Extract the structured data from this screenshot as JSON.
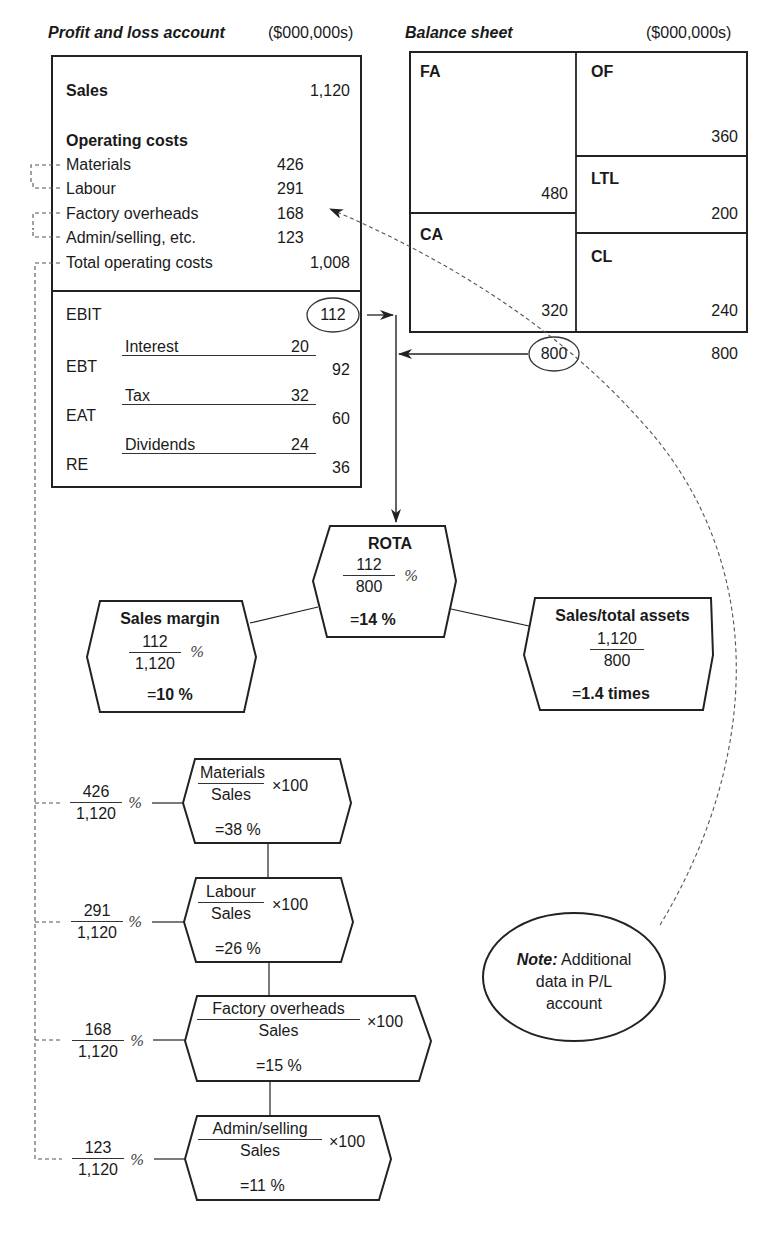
{
  "pl": {
    "title": "Profit and loss account",
    "units": "($000,000s)",
    "sales_label": "Sales",
    "sales_value": "1,120",
    "opcosts_heading": "Operating costs",
    "opcosts": [
      {
        "label": "Materials",
        "value": "426"
      },
      {
        "label": "Labour",
        "value": "291"
      },
      {
        "label": "Factory overheads",
        "value": "168"
      },
      {
        "label": "Admin/selling, etc.",
        "value": "123"
      }
    ],
    "total_label": "Total operating costs",
    "total_value": "1,008",
    "ebit_label": "EBIT",
    "ebit_value": "112",
    "interest_label": "Interest",
    "interest_value": "20",
    "ebt_label": "EBT",
    "ebt_value": "92",
    "tax_label": "Tax",
    "tax_value": "32",
    "eat_label": "EAT",
    "eat_value": "60",
    "dividends_label": "Dividends",
    "dividends_value": "24",
    "re_label": "RE",
    "re_value": "36"
  },
  "bs": {
    "title": "Balance sheet",
    "units": "($000,000s)",
    "fa_label": "FA",
    "fa_value": "480",
    "ca_label": "CA",
    "ca_value": "320",
    "of_label": "OF",
    "of_value": "360",
    "ltl_label": "LTL",
    "ltl_value": "200",
    "cl_label": "CL",
    "cl_value": "240",
    "total_assets": "800",
    "total_liabilities": "800"
  },
  "rota": {
    "title": "ROTA",
    "num": "112",
    "den": "800",
    "pct": "%",
    "eq": "=",
    "result": "14 %"
  },
  "sales_margin": {
    "title": "Sales margin",
    "num": "112",
    "den": "1,120",
    "pct": "%",
    "eq": "=",
    "result": "10 %"
  },
  "asset_turnover": {
    "title": "Sales/total assets",
    "num": "1,120",
    "den": "800",
    "eq": "=",
    "result": "1.4 times"
  },
  "cost_ratios": [
    {
      "num": "426",
      "den": "1,120",
      "pct": "%",
      "label": "Materials",
      "base": "Sales",
      "mult": "×100",
      "eq": "=",
      "result": "38 %"
    },
    {
      "num": "291",
      "den": "1,120",
      "pct": "%",
      "label": "Labour",
      "base": "Sales",
      "mult": "×100",
      "eq": "=",
      "result": "26 %"
    },
    {
      "num": "168",
      "den": "1,120",
      "pct": "%",
      "label": "Factory overheads",
      "base": "Sales",
      "mult": "×100",
      "eq": "=",
      "result": "15 %"
    },
    {
      "num": "123",
      "den": "1,120",
      "pct": "%",
      "label": "Admin/selling",
      "base": "Sales",
      "mult": "×100",
      "eq": "=",
      "result": "11 %"
    }
  ],
  "note": {
    "bold": "Note:",
    "text1": " Additional",
    "text2": "data in P/L",
    "text3": "account"
  },
  "colors": {
    "line": "#222222",
    "dash": "#555555",
    "text": "#1a1a1a"
  }
}
